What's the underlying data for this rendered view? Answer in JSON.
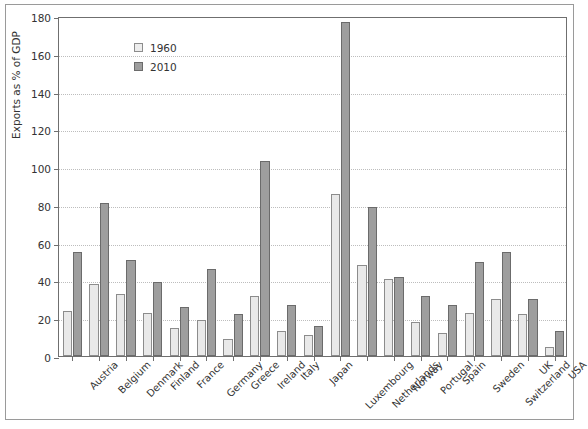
{
  "chart_data": {
    "type": "bar",
    "title": "",
    "subtitle": "",
    "xlabel": "",
    "ylabel": "Exports as % of GDP",
    "ylim": [
      0,
      180
    ],
    "ytick_step": 20,
    "yticks": [
      0,
      20,
      40,
      60,
      80,
      100,
      120,
      140,
      160,
      180
    ],
    "ytick_labels": [
      "0",
      "20",
      "40",
      "60",
      "80",
      "100",
      "120",
      "140",
      "160",
      "180"
    ],
    "grid": true,
    "grid_axis": "y",
    "grid_style": "dotted",
    "legend_position": "top-left",
    "legend": [
      "1960",
      "2010"
    ],
    "categories": [
      "Austria",
      "Belgium",
      "Denmark",
      "Finland",
      "France",
      "Germany",
      "Greece",
      "Ireland",
      "Italy",
      "Japan",
      "Luxembourg",
      "Netherlands",
      "Norway",
      "Portugal",
      "Spain",
      "Sweden",
      "Switzerland",
      "UK",
      "USA"
    ],
    "series": [
      {
        "name": "1960",
        "color": "#e9e9e9",
        "edge_color": "#8c8c8c",
        "values": [
          24,
          38,
          33,
          23,
          15,
          19,
          9,
          32,
          13,
          11,
          86,
          48,
          41,
          18,
          12,
          23,
          30,
          22,
          5
        ]
      },
      {
        "name": "2010",
        "color": "#9e9e9e",
        "edge_color": "#6b6b6b",
        "values": [
          55,
          81,
          51,
          39,
          26,
          46,
          22,
          103,
          27,
          16,
          177,
          79,
          42,
          32,
          27,
          50,
          55,
          30,
          13
        ]
      }
    ]
  },
  "colors": {
    "series_1960": "#e9e9e9",
    "series_2010": "#9e9e9e",
    "axis": "#6f6f6f",
    "grid": "#bdbdbd",
    "frame": "#9a9a9a",
    "text": "#333333",
    "background": "#ffffff"
  }
}
